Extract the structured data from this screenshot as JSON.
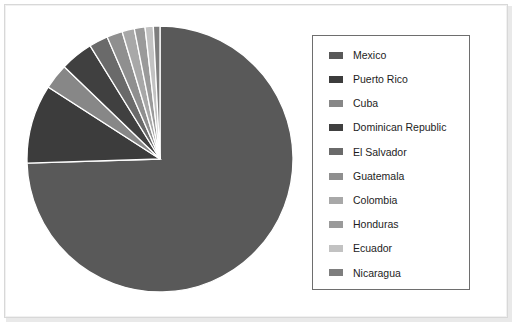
{
  "chart_data": {
    "type": "pie",
    "title": "",
    "categories": [
      "Mexico",
      "Puerto Rico",
      "Cuba",
      "Dominican Republic",
      "El Salvador",
      "Guatemala",
      "Colombia",
      "Honduras",
      "Ecuador",
      "Nicaragua"
    ],
    "values": [
      74.5,
      9.6,
      3.1,
      4.0,
      2.3,
      1.9,
      1.5,
      1.3,
      1.0,
      0.8
    ],
    "units": "percent",
    "start_angle_deg": 0,
    "direction": "clockwise",
    "legend_position": "right",
    "grid": false,
    "colors": [
      "#595959",
      "#3c3c3c",
      "#878787",
      "#404040",
      "#6a6a6a",
      "#8f8f8f",
      "#a8a8a8",
      "#9a9a9a",
      "#c2c2c2",
      "#7e7e7e"
    ],
    "slices": [
      {
        "label": "Mexico",
        "value": 74.5,
        "color": "#595959"
      },
      {
        "label": "Puerto Rico",
        "value": 9.6,
        "color": "#3c3c3c"
      },
      {
        "label": "Cuba",
        "value": 3.1,
        "color": "#878787"
      },
      {
        "label": "Dominican Republic",
        "value": 4.0,
        "color": "#404040"
      },
      {
        "label": "El Salvador",
        "value": 2.3,
        "color": "#6a6a6a"
      },
      {
        "label": "Guatemala",
        "value": 1.9,
        "color": "#8f8f8f"
      },
      {
        "label": "Colombia",
        "value": 1.5,
        "color": "#a8a8a8"
      },
      {
        "label": "Honduras",
        "value": 1.3,
        "color": "#9a9a9a"
      },
      {
        "label": "Ecuador",
        "value": 1.0,
        "color": "#c2c2c2"
      },
      {
        "label": "Nicaragua",
        "value": 0.8,
        "color": "#7e7e7e"
      }
    ]
  },
  "legend": {
    "items": [
      {
        "label": "Mexico",
        "color": "#595959"
      },
      {
        "label": "Puerto Rico",
        "color": "#3c3c3c"
      },
      {
        "label": "Cuba",
        "color": "#878787"
      },
      {
        "label": "Dominican Republic",
        "color": "#404040"
      },
      {
        "label": "El Salvador",
        "color": "#6a6a6a"
      },
      {
        "label": "Guatemala",
        "color": "#8f8f8f"
      },
      {
        "label": "Colombia",
        "color": "#a8a8a8"
      },
      {
        "label": "Honduras",
        "color": "#9a9a9a"
      },
      {
        "label": "Ecuador",
        "color": "#c2c2c2"
      },
      {
        "label": "Nicaragua",
        "color": "#7e7e7e"
      }
    ]
  },
  "style": {
    "slice_border": "#ffffff",
    "legend_border": "#6e6e6e",
    "page_background": "#ffffff",
    "frame_border": "#d8d8d8"
  }
}
